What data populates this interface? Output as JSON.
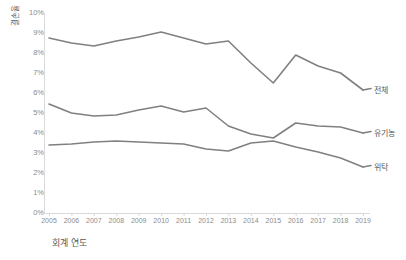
{
  "chart_data": {
    "type": "line",
    "title": "",
    "xlabel": "회계 연도",
    "ylabel": "결손율",
    "x": [
      2005,
      2006,
      2007,
      2008,
      2009,
      2010,
      2011,
      2012,
      2013,
      2014,
      2015,
      2016,
      2017,
      2018,
      2019
    ],
    "categories": [
      "2005",
      "2006",
      "2007",
      "2008",
      "2009",
      "2010",
      "2011",
      "2012",
      "2013",
      "2014",
      "2015",
      "2016",
      "2017",
      "2018",
      "2019"
    ],
    "ylim": [
      0,
      10
    ],
    "ytick_labels": [
      "0%",
      "1%",
      "2%",
      "3%",
      "4%",
      "5%",
      "6%",
      "7%",
      "8%",
      "9%",
      "10%"
    ],
    "ytick_values": [
      0,
      1,
      2,
      3,
      4,
      5,
      6,
      7,
      8,
      9,
      10
    ],
    "grid": false,
    "legend": "right-inline",
    "series": [
      {
        "name": "전체",
        "color": "#808080",
        "values": [
          8.75,
          8.5,
          8.35,
          8.6,
          8.8,
          9.05,
          8.75,
          8.45,
          8.6,
          7.5,
          6.5,
          7.9,
          7.35,
          7.0,
          6.15
        ]
      },
      {
        "name": "유기농",
        "color": "#808080",
        "values": [
          5.45,
          5.0,
          4.85,
          4.9,
          5.15,
          5.35,
          5.05,
          5.25,
          4.35,
          3.95,
          3.75,
          4.5,
          4.35,
          4.3,
          4.0
        ]
      },
      {
        "name": "위탁",
        "color": "#808080",
        "values": [
          3.4,
          3.45,
          3.55,
          3.6,
          3.55,
          3.5,
          3.45,
          3.2,
          3.1,
          3.5,
          3.6,
          3.3,
          3.05,
          2.75,
          2.3
        ]
      }
    ]
  },
  "axis": {
    "y_title": "결손율",
    "x_title": "회계 연도"
  },
  "plot_geometry": {
    "left": 49,
    "right": 363,
    "top_value_y": 13,
    "px_per_percent": 20,
    "zero_y": 213
  }
}
